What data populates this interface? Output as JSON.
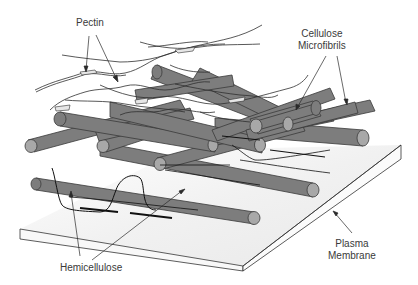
{
  "diagram": {
    "labels": {
      "pectin": "Pectin",
      "cellulose_line1": "Cellulose",
      "cellulose_line2": "Microfibrils",
      "hemicellulose": "Hemicellulose",
      "membrane_line1": "Plasma",
      "membrane_line2": "Membrane"
    },
    "colors": {
      "rod_body": "#7d7d7d",
      "rod_cap": "#a8a8a8",
      "outline": "#2a2a2a",
      "membrane_fill": "#f3f3f3",
      "label_text": "#3a3a3a"
    }
  }
}
